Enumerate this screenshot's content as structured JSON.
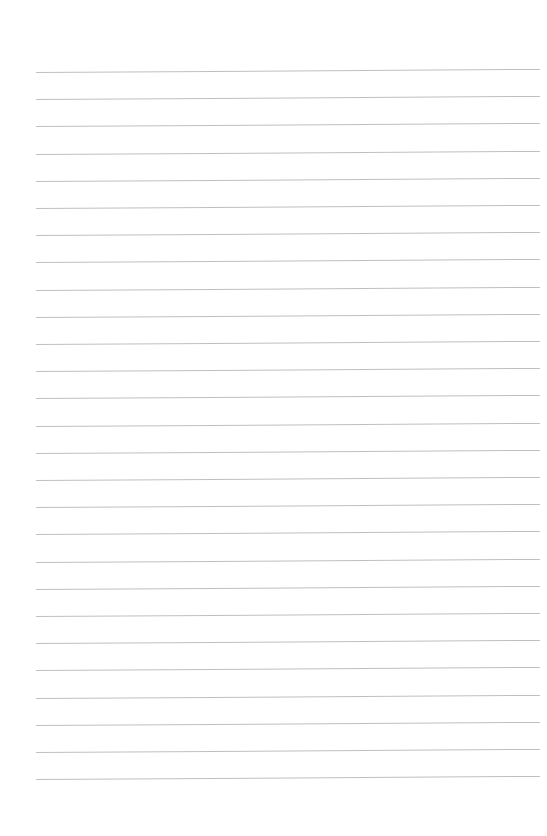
{
  "page": {
    "type": "lined-paper",
    "background_color": "#ffffff",
    "line_color": "#b4b4b4",
    "line_count": 27,
    "first_line_y": 72,
    "line_spacing": 27.2,
    "line_left_x": 36,
    "line_right_x": 540
  }
}
